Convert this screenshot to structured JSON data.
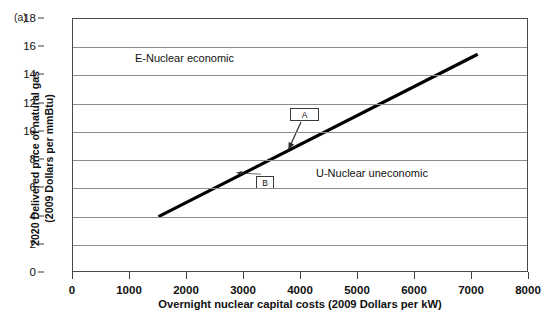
{
  "panel": {
    "label": "(a)"
  },
  "chart_data": {
    "type": "line",
    "title": "",
    "subtitle": "",
    "xlabel": "Overnight nuclear capital costs (2009 Dollars per kW)",
    "ylabel": "2020 Delivered price of natural gas (2009 Dollars per mmBtu)",
    "ylabel_line1": "2020 Delivered price of natural gas",
    "ylabel_line2": "(2009 Dollars per mmBtu)",
    "xlim": [
      0,
      8000
    ],
    "ylim": [
      0,
      18
    ],
    "xticks": [
      0,
      1000,
      2000,
      3000,
      4000,
      5000,
      6000,
      7000,
      8000
    ],
    "xticklabels": [
      "0",
      "1000",
      "2000",
      "3000",
      "4000",
      "5000",
      "6000",
      "7000",
      "8000"
    ],
    "yticks": [
      0,
      2,
      4,
      6,
      8,
      10,
      12,
      14,
      16,
      18
    ],
    "yticklabels": [
      "0",
      "2",
      "4",
      "6",
      "8",
      "10",
      "12",
      "14",
      "16",
      "18"
    ],
    "grid": "horizontal",
    "legend": "none",
    "series": [
      {
        "name": "breakeven-line",
        "color": "#000000",
        "linewidth": 3.2,
        "x": [
          1500,
          7100
        ],
        "y": [
          4.0,
          15.5
        ]
      }
    ],
    "annotations": [
      {
        "id": "A",
        "label": "A",
        "box_x": 4000,
        "box_y": 10.7,
        "point_x": 3780,
        "point_y": 8.75
      },
      {
        "id": "B",
        "label": "B",
        "box_x": 3300,
        "box_y": 7.0,
        "point_x": 2870,
        "point_y": 7.1
      }
    ],
    "region_labels": [
      {
        "id": "economic",
        "text": "E-Nuclear economic",
        "x": 1200,
        "y": 16.2
      },
      {
        "id": "uneconomic",
        "text": "U-Nuclear uneconomic",
        "y": 8.0,
        "x": 4380
      }
    ]
  },
  "colors": {
    "line": "#000000",
    "grid": "#8d8d8d",
    "frame": "#4a4a4a",
    "text": "#111111",
    "background": "#ffffff"
  }
}
